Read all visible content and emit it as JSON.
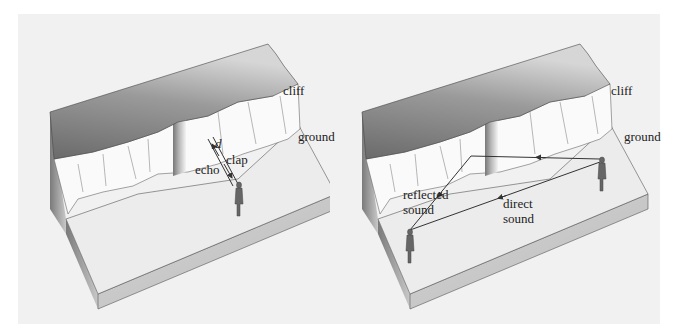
{
  "figure": {
    "left_panel": {
      "labels": {
        "cliff": "cliff",
        "ground": "ground",
        "distance": "d",
        "clap": "clap",
        "echo": "echo"
      }
    },
    "right_panel": {
      "labels": {
        "cliff": "cliff",
        "ground": "ground",
        "reflected_line1": "reflected",
        "reflected_line2": "sound",
        "direct_line1": "direct",
        "direct_line2": "sound"
      }
    }
  },
  "colors": {
    "background": "#f1f1f1",
    "cliff_top_dark": "#6e6e6e",
    "cliff_top_light": "#d8d8d8",
    "cliff_face": "#fafafa",
    "ground": "#ececec",
    "base_side": "#c4c4c4",
    "arrow": "#333333"
  }
}
